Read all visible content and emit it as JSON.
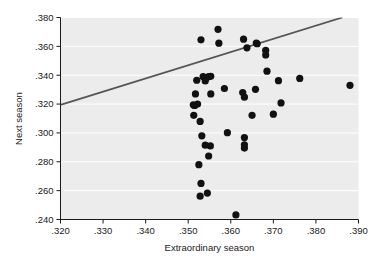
{
  "chart_data": {
    "type": "scatter",
    "title": "",
    "xlabel": "Extraordinary season",
    "ylabel": "Next season",
    "xlim": [
      0.32,
      0.39
    ],
    "ylim": [
      0.24,
      0.38
    ],
    "xticks": [
      0.32,
      0.33,
      0.34,
      0.35,
      0.36,
      0.37,
      0.38,
      0.39
    ],
    "xticklabels": [
      ".320",
      ".330",
      ".340",
      ".350",
      ".360",
      ".370",
      ".380",
      ".390"
    ],
    "yticks": [
      0.24,
      0.26,
      0.28,
      0.3,
      0.32,
      0.34,
      0.36,
      0.38
    ],
    "yticklabels": [
      ".240",
      ".260",
      ".280",
      ".300",
      ".320",
      ".340",
      ".360",
      ".380"
    ],
    "grid": "horizontal",
    "legend": "none",
    "plot_background_color": "#ececec",
    "gridline_color": "#ffffff",
    "marker_color": "#111111",
    "marker_size": 4.6,
    "trendline": {
      "name": "regression line",
      "color": "#555555",
      "width": 1.8,
      "x_start": 0.32,
      "y_start": 0.3195,
      "x_end": 0.3862,
      "y_end": 0.38
    },
    "points": [
      {
        "x": 0.352,
        "y": 0.3365
      },
      {
        "x": 0.3517,
        "y": 0.327
      },
      {
        "x": 0.3512,
        "y": 0.3195
      },
      {
        "x": 0.3515,
        "y": 0.319
      },
      {
        "x": 0.3522,
        "y": 0.32
      },
      {
        "x": 0.3513,
        "y": 0.3122
      },
      {
        "x": 0.353,
        "y": 0.3645
      },
      {
        "x": 0.3535,
        "y": 0.339
      },
      {
        "x": 0.3543,
        "y": 0.3383
      },
      {
        "x": 0.354,
        "y": 0.336
      },
      {
        "x": 0.3548,
        "y": 0.339
      },
      {
        "x": 0.3553,
        "y": 0.3392
      },
      {
        "x": 0.3528,
        "y": 0.308
      },
      {
        "x": 0.3532,
        "y": 0.298
      },
      {
        "x": 0.354,
        "y": 0.2915
      },
      {
        "x": 0.3552,
        "y": 0.291
      },
      {
        "x": 0.3548,
        "y": 0.284
      },
      {
        "x": 0.3525,
        "y": 0.278
      },
      {
        "x": 0.353,
        "y": 0.265
      },
      {
        "x": 0.3528,
        "y": 0.2562
      },
      {
        "x": 0.3545,
        "y": 0.2583
      },
      {
        "x": 0.3553,
        "y": 0.327
      },
      {
        "x": 0.357,
        "y": 0.3718
      },
      {
        "x": 0.3572,
        "y": 0.3622
      },
      {
        "x": 0.3585,
        "y": 0.3308
      },
      {
        "x": 0.3592,
        "y": 0.3002
      },
      {
        "x": 0.3612,
        "y": 0.2432
      },
      {
        "x": 0.3628,
        "y": 0.328
      },
      {
        "x": 0.3632,
        "y": 0.3248
      },
      {
        "x": 0.363,
        "y": 0.365
      },
      {
        "x": 0.3638,
        "y": 0.359
      },
      {
        "x": 0.3632,
        "y": 0.2968
      },
      {
        "x": 0.3632,
        "y": 0.2918
      },
      {
        "x": 0.3632,
        "y": 0.2895
      },
      {
        "x": 0.3658,
        "y": 0.3302
      },
      {
        "x": 0.366,
        "y": 0.3623
      },
      {
        "x": 0.3662,
        "y": 0.3618
      },
      {
        "x": 0.365,
        "y": 0.3122
      },
      {
        "x": 0.3682,
        "y": 0.3572
      },
      {
        "x": 0.3682,
        "y": 0.354
      },
      {
        "x": 0.3685,
        "y": 0.3428
      },
      {
        "x": 0.37,
        "y": 0.313
      },
      {
        "x": 0.3712,
        "y": 0.3362
      },
      {
        "x": 0.3718,
        "y": 0.3208
      },
      {
        "x": 0.3762,
        "y": 0.3378
      },
      {
        "x": 0.388,
        "y": 0.333
      }
    ]
  }
}
